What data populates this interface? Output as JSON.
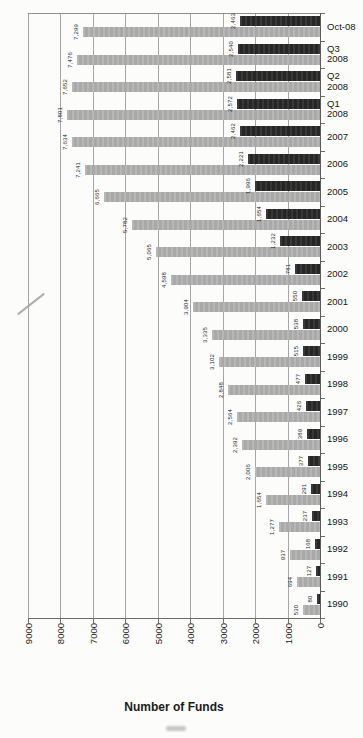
{
  "chart_data": {
    "type": "bar",
    "orientation": "page rotated 90deg CCW: categories run bottom-to-top on right edge, values increase right-to-left along bottom",
    "title": "",
    "legend": "none",
    "grid": true,
    "data_labels": "thousands-comma, rotated",
    "value_axis": {
      "label": "Number of Funds",
      "min": 0,
      "max": 9000,
      "ticks": [
        9000,
        8000,
        7000,
        6000,
        5000,
        4000,
        3000,
        2000,
        1000,
        0
      ]
    },
    "categories": [
      "1990",
      "1991",
      "1992",
      "1993",
      "1994",
      "1995",
      "1996",
      "1997",
      "1998",
      "1999",
      "2000",
      "2001",
      "2002",
      "2003",
      "2004",
      "2005",
      "2006",
      "2007",
      "Q1 2008",
      "Q2 2008",
      "Q3 2008",
      "Oct-08"
    ],
    "series": [
      {
        "name": "gray-bars",
        "color": "#b2b2b2",
        "values": [
          530,
          694,
          937,
          1277,
          1654,
          2006,
          2392,
          2564,
          2848,
          3102,
          3335,
          3904,
          4598,
          5065,
          5782,
          6665,
          7241,
          7634,
          7801,
          7652,
          7476,
          7299
        ]
      },
      {
        "name": "black-bars",
        "color": "#2d2d2d",
        "values": [
          80,
          127,
          168,
          237,
          291,
          377,
          389,
          426,
          477,
          515,
          538,
          550,
          781,
          1232,
          1654,
          1996,
          2221,
          2462,
          2572,
          2581,
          2540,
          2463
        ]
      }
    ]
  }
}
